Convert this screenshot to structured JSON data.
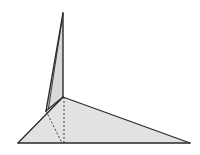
{
  "figure": {
    "type": "3d-polyhedron-line-drawing",
    "colors": {
      "background": "#ffffff",
      "face_fill": "#e2e2e2",
      "fin_fill": "#d8d8d8",
      "edge": "#2a2a2a",
      "hidden_edge": "#3a3a3a"
    },
    "vertices": {
      "apex": [
        63,
        13
      ],
      "inner_top": [
        63,
        97
      ],
      "left_upper": [
        46,
        111
      ],
      "bottom_left": [
        18,
        143
      ],
      "bottom_mid": [
        63,
        143
      ],
      "bottom_right": [
        190,
        143
      ]
    },
    "faces": [
      {
        "name": "base-triangle",
        "points": "18,143 63,97 190,143"
      },
      {
        "name": "fin",
        "points": "46,111 63,13 63,97"
      }
    ],
    "visible_edges": [
      {
        "name": "fin-left-edge",
        "from": [
          46,
          111
        ],
        "to": [
          63,
          13
        ]
      },
      {
        "name": "fin-left-edge-inner",
        "from": [
          48,
          108
        ],
        "to": [
          62,
          18
        ]
      },
      {
        "name": "fin-right-edge",
        "from": [
          63,
          13
        ],
        "to": [
          63,
          97
        ]
      },
      {
        "name": "base-left-edge",
        "from": [
          18,
          143
        ],
        "to": [
          63,
          97
        ]
      },
      {
        "name": "base-right-edge",
        "from": [
          63,
          97
        ],
        "to": [
          190,
          143
        ]
      },
      {
        "name": "base-bottom-edge",
        "from": [
          18,
          143
        ],
        "to": [
          190,
          143
        ]
      },
      {
        "name": "fin-base-edge",
        "from": [
          46,
          111
        ],
        "to": [
          63,
          97
        ]
      }
    ],
    "hidden_edges": [
      {
        "name": "vertical-altitude",
        "from": [
          64,
          97
        ],
        "to": [
          64,
          143
        ]
      },
      {
        "name": "slant-hidden-edge",
        "from": [
          46,
          111
        ],
        "to": [
          62,
          143
        ]
      }
    ]
  }
}
